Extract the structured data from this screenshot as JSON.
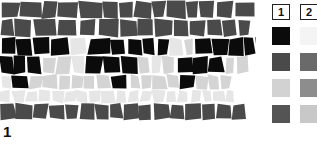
{
  "legend": {
    "columns": [
      {
        "header": "1",
        "swatches": [
          {
            "name": "black",
            "color": "#0b0b0b"
          },
          {
            "name": "dark-gray",
            "color": "#4a4a4a"
          },
          {
            "name": "light-gray",
            "color": "#d2d2d2"
          },
          {
            "name": "gray",
            "color": "#545454"
          }
        ]
      },
      {
        "header": "2",
        "swatches": [
          {
            "name": "white",
            "color": "#f4f4f4"
          },
          {
            "name": "dark-gray",
            "color": "#6a6a6a"
          },
          {
            "name": "medium-gray",
            "color": "#8d8d8d"
          },
          {
            "name": "light-gray",
            "color": "#c8c8c8"
          }
        ]
      }
    ]
  },
  "mosaic": {
    "row_label": "1",
    "palette": {
      "black": "#0b0b0b",
      "dark": "#4a4a4a",
      "mid": "#9a9a9a",
      "light": "#d4d4d4",
      "pale": "#e6e6e6",
      "white": "#f2f2f2"
    },
    "rows": [
      {
        "y": 2,
        "h": 22,
        "tiles": [
          {
            "w": 20,
            "t": "dark"
          },
          {
            "w": 22,
            "t": "dark"
          },
          {
            "w": 16,
            "t": "dark"
          },
          {
            "w": 21,
            "t": "dark"
          },
          {
            "w": 23,
            "t": "dark"
          },
          {
            "w": 17,
            "t": "dark"
          },
          {
            "w": 15,
            "t": "dark"
          },
          {
            "w": 18,
            "t": "dark"
          },
          {
            "w": 14,
            "t": "dark"
          },
          {
            "w": 20,
            "t": "dark"
          },
          {
            "w": 13,
            "t": "dark"
          },
          {
            "w": 16,
            "t": "dark"
          },
          {
            "w": 19,
            "t": "dark"
          },
          {
            "w": 20,
            "t": "dark"
          }
        ]
      },
      {
        "y": 25,
        "h": 22,
        "tiles": [
          {
            "w": 14,
            "t": "dark"
          },
          {
            "w": 19,
            "t": "dark"
          },
          {
            "w": 24,
            "t": "dark"
          },
          {
            "w": 21,
            "t": "dark"
          },
          {
            "w": 19,
            "t": "dark"
          },
          {
            "w": 23,
            "t": "dark"
          },
          {
            "w": 18,
            "t": "dark"
          },
          {
            "w": 16,
            "t": "dark"
          },
          {
            "w": 20,
            "t": "dark"
          },
          {
            "w": 15,
            "t": "dark"
          },
          {
            "w": 17,
            "t": "dark"
          },
          {
            "w": 16,
            "t": "dark"
          },
          {
            "w": 15,
            "t": "dark"
          },
          {
            "w": 13,
            "t": "dark"
          }
        ]
      },
      {
        "y": 48,
        "h": 22,
        "tiles": [
          {
            "w": 15,
            "t": "black"
          },
          {
            "w": 17,
            "t": "black"
          },
          {
            "w": 18,
            "t": "black"
          },
          {
            "w": 20,
            "t": "black"
          },
          {
            "w": 18,
            "t": "pale"
          },
          {
            "w": 22,
            "t": "black"
          },
          {
            "w": 16,
            "t": "black"
          },
          {
            "w": 16,
            "t": "black"
          },
          {
            "w": 14,
            "t": "black"
          },
          {
            "w": 13,
            "t": "black"
          },
          {
            "w": 15,
            "t": "pale"
          },
          {
            "w": 10,
            "t": "light"
          },
          {
            "w": 18,
            "t": "black"
          },
          {
            "w": 17,
            "t": "black"
          },
          {
            "w": 14,
            "t": "black"
          },
          {
            "w": 12,
            "t": "black"
          },
          {
            "w": 11,
            "t": "black"
          }
        ]
      },
      {
        "y": 71,
        "h": 22,
        "tiles": [
          {
            "w": 14,
            "t": "black"
          },
          {
            "w": 13,
            "t": "black"
          },
          {
            "w": 14,
            "t": "black"
          },
          {
            "w": 15,
            "t": "light"
          },
          {
            "w": 16,
            "t": "light"
          },
          {
            "w": 14,
            "t": "pale"
          },
          {
            "w": 17,
            "t": "black"
          },
          {
            "w": 18,
            "t": "black"
          },
          {
            "w": 16,
            "t": "black"
          },
          {
            "w": 13,
            "t": "light"
          },
          {
            "w": 12,
            "t": "pale"
          },
          {
            "w": 14,
            "t": "light"
          },
          {
            "w": 17,
            "t": "black"
          },
          {
            "w": 15,
            "t": "black"
          },
          {
            "w": 16,
            "t": "black"
          },
          {
            "w": 12,
            "t": "light"
          },
          {
            "w": 12,
            "t": "light"
          }
        ]
      },
      {
        "y": 94,
        "h": 18,
        "tiles": [
          {
            "w": 11,
            "t": "pale"
          },
          {
            "w": 17,
            "t": "black"
          },
          {
            "w": 15,
            "t": "light"
          },
          {
            "w": 14,
            "t": "light"
          },
          {
            "w": 13,
            "t": "light"
          },
          {
            "w": 14,
            "t": "light"
          },
          {
            "w": 12,
            "t": "light"
          },
          {
            "w": 15,
            "t": "light"
          },
          {
            "w": 17,
            "t": "black"
          },
          {
            "w": 13,
            "t": "light"
          },
          {
            "w": 12,
            "t": "light"
          },
          {
            "w": 14,
            "t": "light"
          },
          {
            "w": 13,
            "t": "light"
          },
          {
            "w": 16,
            "t": "black"
          },
          {
            "w": 12,
            "t": "light"
          },
          {
            "w": 13,
            "t": "light"
          },
          {
            "w": 11,
            "t": "light"
          }
        ]
      },
      {
        "y": 113,
        "h": 16,
        "tiles": [
          {
            "w": 12,
            "t": "pale"
          },
          {
            "w": 13,
            "t": "pale"
          },
          {
            "w": 12,
            "t": "pale"
          },
          {
            "w": 14,
            "t": "pale"
          },
          {
            "w": 13,
            "t": "pale"
          },
          {
            "w": 12,
            "t": "pale"
          },
          {
            "w": 13,
            "t": "pale"
          },
          {
            "w": 12,
            "t": "pale"
          },
          {
            "w": 14,
            "t": "pale"
          },
          {
            "w": 12,
            "t": "pale"
          },
          {
            "w": 13,
            "t": "pale"
          },
          {
            "w": 12,
            "t": "pale"
          },
          {
            "w": 13,
            "t": "pale"
          },
          {
            "w": 12,
            "t": "pale"
          },
          {
            "w": 13,
            "t": "pale"
          },
          {
            "w": 12,
            "t": "pale"
          },
          {
            "w": 11,
            "t": "pale"
          },
          {
            "w": 12,
            "t": "pale"
          },
          {
            "w": 11,
            "t": "pale"
          }
        ]
      },
      {
        "y": 130,
        "h": 20,
        "tiles": [
          {
            "w": 16,
            "t": "dark"
          },
          {
            "w": 17,
            "t": "dark"
          },
          {
            "w": 15,
            "t": "dark"
          },
          {
            "w": 17,
            "t": "dark"
          },
          {
            "w": 14,
            "t": "dark"
          },
          {
            "w": 16,
            "t": "dark"
          },
          {
            "w": 15,
            "t": "dark"
          },
          {
            "w": 13,
            "t": "dark"
          },
          {
            "w": 16,
            "t": "dark"
          },
          {
            "w": 14,
            "t": "dark"
          },
          {
            "w": 17,
            "t": "dark"
          },
          {
            "w": 15,
            "t": "dark"
          },
          {
            "w": 16,
            "t": "dark"
          },
          {
            "w": 14,
            "t": "dark"
          },
          {
            "w": 16,
            "t": "dark"
          },
          {
            "w": 15,
            "t": "dark"
          }
        ]
      }
    ]
  }
}
